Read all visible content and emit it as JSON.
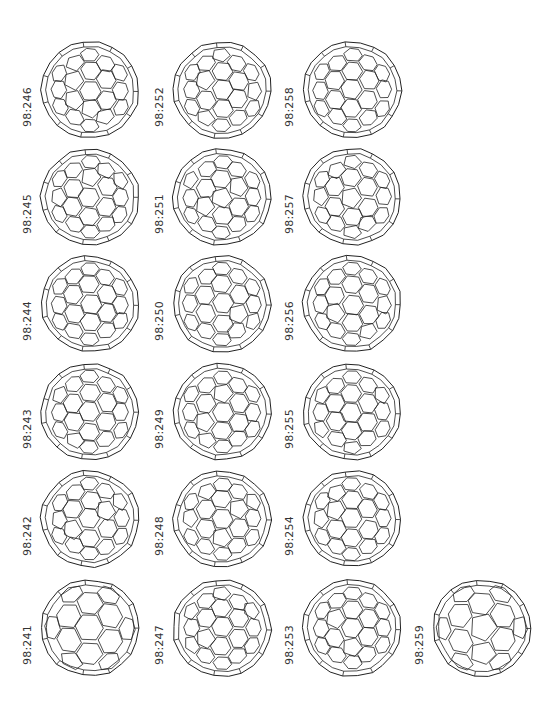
{
  "figure": {
    "line_color": "#222222",
    "isomers": [
      {
        "label": "98:246",
        "col": 0,
        "row": 0
      },
      {
        "label": "98:245",
        "col": 0,
        "row": 1
      },
      {
        "label": "98:244",
        "col": 0,
        "row": 2
      },
      {
        "label": "98:243",
        "col": 0,
        "row": 3
      },
      {
        "label": "98:242",
        "col": 0,
        "row": 4
      },
      {
        "label": "98:241",
        "col": 0,
        "row": 5
      },
      {
        "label": "98:252",
        "col": 1,
        "row": 0
      },
      {
        "label": "98:251",
        "col": 1,
        "row": 1
      },
      {
        "label": "98:250",
        "col": 1,
        "row": 2
      },
      {
        "label": "98:249",
        "col": 1,
        "row": 3
      },
      {
        "label": "98:248",
        "col": 1,
        "row": 4
      },
      {
        "label": "98:247",
        "col": 1,
        "row": 5
      },
      {
        "label": "98:258",
        "col": 2,
        "row": 0
      },
      {
        "label": "98:257",
        "col": 2,
        "row": 1
      },
      {
        "label": "98:256",
        "col": 2,
        "row": 2
      },
      {
        "label": "98:255",
        "col": 2,
        "row": 3
      },
      {
        "label": "98:254",
        "col": 2,
        "row": 4
      },
      {
        "label": "98:253",
        "col": 2,
        "row": 5
      },
      {
        "label": "98:259",
        "col": 3,
        "row": 5
      }
    ]
  }
}
